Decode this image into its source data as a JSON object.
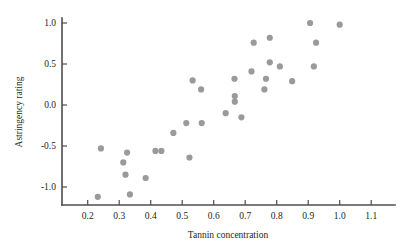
{
  "chart_data": {
    "type": "scatter",
    "title": "",
    "xlabel": "Tannin concentration",
    "ylabel": "Astringency rating",
    "xlim": [
      0.155,
      1.145
    ],
    "ylim": [
      -1.26,
      1.12
    ],
    "grid": false,
    "legend": null,
    "xticks": [
      0.2,
      0.3,
      0.4,
      0.5,
      0.6,
      0.7,
      0.8,
      0.9,
      1.0,
      1.1
    ],
    "xticklabels": [
      "0.2",
      "0.3",
      "0.4",
      "0.5",
      "0.6",
      "0.7",
      "0.8",
      "0.9",
      "1.0",
      "1.1"
    ],
    "yticks": [
      1.0,
      0.5,
      0.0,
      -0.5,
      -1.0
    ],
    "yticklabels": [
      "1.0",
      "0.5",
      "0.0",
      "-0.5",
      "-1.0"
    ],
    "marker": {
      "shape": "circle",
      "color": "#9a9a9c",
      "size": 4.2
    },
    "points": [
      {
        "x": 0.242,
        "y": -0.53
      },
      {
        "x": 0.232,
        "y": -1.12
      },
      {
        "x": 0.325,
        "y": -0.58
      },
      {
        "x": 0.313,
        "y": -0.7
      },
      {
        "x": 0.32,
        "y": -0.85
      },
      {
        "x": 0.334,
        "y": -1.09
      },
      {
        "x": 0.384,
        "y": -0.89
      },
      {
        "x": 0.415,
        "y": -0.56
      },
      {
        "x": 0.434,
        "y": -0.56
      },
      {
        "x": 0.472,
        "y": -0.34
      },
      {
        "x": 0.513,
        "y": -0.22
      },
      {
        "x": 0.523,
        "y": -0.64
      },
      {
        "x": 0.533,
        "y": 0.3
      },
      {
        "x": 0.56,
        "y": 0.19
      },
      {
        "x": 0.562,
        "y": -0.22
      },
      {
        "x": 0.638,
        "y": -0.1
      },
      {
        "x": 0.666,
        "y": 0.32
      },
      {
        "x": 0.667,
        "y": 0.11
      },
      {
        "x": 0.667,
        "y": 0.04
      },
      {
        "x": 0.688,
        "y": -0.15
      },
      {
        "x": 0.72,
        "y": 0.41
      },
      {
        "x": 0.727,
        "y": 0.76
      },
      {
        "x": 0.761,
        "y": 0.19
      },
      {
        "x": 0.766,
        "y": 0.32
      },
      {
        "x": 0.778,
        "y": 0.52
      },
      {
        "x": 0.778,
        "y": 0.82
      },
      {
        "x": 0.81,
        "y": 0.47
      },
      {
        "x": 0.849,
        "y": 0.29
      },
      {
        "x": 0.906,
        "y": 1.0
      },
      {
        "x": 0.918,
        "y": 0.47
      },
      {
        "x": 0.925,
        "y": 0.76
      },
      {
        "x": 1.0,
        "y": 0.98
      }
    ]
  },
  "colors": {
    "axis": "#4f4c4d",
    "marker": "#9a9a9c",
    "text": "#231f20",
    "background": "#ffffff"
  }
}
